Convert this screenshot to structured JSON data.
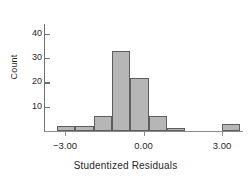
{
  "chart_data": {
    "type": "bar",
    "title": "",
    "subtitle": "",
    "xlabel": "Studentized Residuals",
    "ylabel": "Count",
    "xlim": [
      -3.8,
      3.8
    ],
    "ylim": [
      0,
      44
    ],
    "grid": false,
    "legend": null,
    "bin_width": 0.7,
    "bin_edges": [
      -3.3,
      -2.6,
      -1.9,
      -1.2,
      -0.5,
      0.2,
      0.9,
      1.6,
      2.3,
      3.0,
      3.7
    ],
    "bin_centers": [
      -2.95,
      -2.25,
      -1.55,
      -0.85,
      -0.15,
      0.55,
      1.25,
      1.95,
      2.65,
      3.35
    ],
    "categories": [
      "-2.95",
      "-2.25",
      "-1.55",
      "-0.85",
      "-0.15",
      "0.55",
      "1.25",
      "1.95",
      "2.65",
      "3.35"
    ],
    "values": [
      2,
      2,
      6,
      33,
      22,
      6,
      1,
      0,
      0,
      3
    ],
    "xticks": [
      -3.0,
      0.0,
      3.0
    ],
    "xticklabels": [
      "-3.00",
      "0.00",
      "3.00"
    ],
    "yticks": [
      10,
      20,
      30,
      40
    ],
    "yticklabels": [
      "10",
      "20",
      "30",
      "40"
    ],
    "bar_fill": "#b6b6b6",
    "bar_edge": "#5e5e5e",
    "axis_color": "#7b7b7b"
  }
}
